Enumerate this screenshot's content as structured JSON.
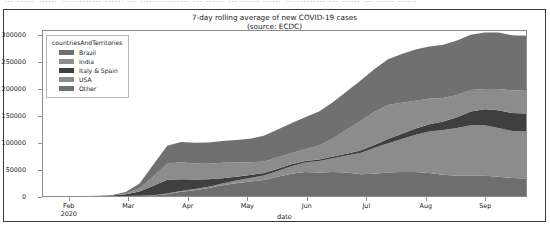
{
  "top_strip": {
    "ghost_text": "… …… …… … ……… …… … …… ……… … …… … …… …… … ……… … …… … …… ……"
  },
  "chart_data": {
    "type": "area",
    "stacked": true,
    "title": "7-day rolling average of new COVID-19 cases\n(source: ECDC)",
    "title_line1": "7-day rolling average of new COVID-19 cases",
    "title_line2": "(source: ECDC)",
    "xlabel": "date",
    "ylabel": "",
    "grid": false,
    "legend_position": "upper left",
    "legend_title": "countriesAndTerritories",
    "ylim": [
      0,
      310000
    ],
    "yticks": [
      0,
      50000,
      100000,
      150000,
      200000,
      250000,
      300000
    ],
    "ytick_labels": [
      "0",
      "50000",
      "100000",
      "150000",
      "200000",
      "250000",
      "300000"
    ],
    "xtick_labels": [
      "Feb",
      "Mar",
      "Apr",
      "May",
      "Jun",
      "Jul",
      "Aug",
      "Sep"
    ],
    "xtick_sublabels": [
      "2020",
      "",
      "",
      "",
      "",
      "",
      "",
      ""
    ],
    "x_range": [
      "2020-01-20",
      "2020-09-24"
    ],
    "x": [
      "2020-01-25",
      "2020-02-01",
      "2020-02-08",
      "2020-02-15",
      "2020-02-22",
      "2020-02-29",
      "2020-03-07",
      "2020-03-14",
      "2020-03-21",
      "2020-03-28",
      "2020-04-04",
      "2020-04-11",
      "2020-04-18",
      "2020-04-25",
      "2020-05-02",
      "2020-05-09",
      "2020-05-16",
      "2020-05-23",
      "2020-05-30",
      "2020-06-06",
      "2020-06-13",
      "2020-06-20",
      "2020-06-27",
      "2020-07-04",
      "2020-07-11",
      "2020-07-18",
      "2020-07-25",
      "2020-08-01",
      "2020-08-08",
      "2020-08-15",
      "2020-08-22",
      "2020-08-29",
      "2020-09-05",
      "2020-09-12",
      "2020-09-19",
      "2020-09-23"
    ],
    "series": [
      {
        "name": "Brazil",
        "color": "#6e6e6e",
        "values": [
          0,
          0,
          0,
          0,
          0,
          0,
          100,
          300,
          900,
          3500,
          8000,
          11000,
          15000,
          20000,
          24000,
          27000,
          30000,
          36000,
          42000,
          45000,
          44000,
          45000,
          44000,
          41000,
          42000,
          44000,
          45000,
          45000,
          43000,
          40000,
          38000,
          38000,
          38000,
          36000,
          34000,
          33000
        ]
      },
      {
        "name": "India",
        "color": "#8c8c8c",
        "values": [
          0,
          0,
          0,
          0,
          0,
          0,
          50,
          120,
          400,
          1000,
          1500,
          2000,
          2500,
          3500,
          5000,
          7000,
          8500,
          11000,
          14000,
          18000,
          22000,
          26000,
          32000,
          40000,
          48000,
          55000,
          62000,
          70000,
          78000,
          84000,
          90000,
          95000,
          95000,
          92000,
          88000,
          88000
        ]
      },
      {
        "name": "Italy & Spain",
        "color": "#3f3f3f",
        "values": [
          0,
          0,
          0,
          0,
          200,
          800,
          3000,
          8000,
          18000,
          26000,
          22000,
          18000,
          14000,
          10000,
          7000,
          5500,
          4500,
          4000,
          3500,
          3000,
          2800,
          3000,
          3500,
          4500,
          6000,
          8000,
          10000,
          12000,
          14000,
          16000,
          20000,
          26000,
          30000,
          33000,
          34000,
          34000
        ]
      },
      {
        "name": "USA",
        "color": "#8c8c8c",
        "values": [
          0,
          0,
          0,
          0,
          50,
          200,
          1500,
          6000,
          18000,
          30000,
          32000,
          30000,
          29000,
          29000,
          27000,
          24000,
          22000,
          22000,
          21000,
          22000,
          26000,
          34000,
          45000,
          55000,
          62000,
          64000,
          58000,
          52000,
          48000,
          44000,
          42000,
          40000,
          38000,
          40000,
          42000,
          44000
        ]
      },
      {
        "name": "Other",
        "color": "#707070",
        "values": [
          30,
          80,
          150,
          200,
          400,
          900,
          3000,
          9000,
          22000,
          34000,
          38000,
          39000,
          40000,
          41000,
          42000,
          44000,
          48000,
          52000,
          56000,
          60000,
          64000,
          68000,
          72000,
          76000,
          80000,
          86000,
          92000,
          96000,
          98000,
          100000,
          102000,
          104000,
          106000,
          106000,
          104000,
          102000
        ]
      }
    ]
  }
}
